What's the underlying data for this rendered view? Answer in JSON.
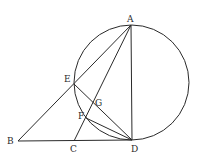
{
  "diagram": {
    "type": "geometry",
    "colors": {
      "line": "#2a2a2a",
      "background": "#ffffff"
    },
    "circle": {
      "cx": 131.5,
      "cy": 82.5,
      "r": 57.5
    },
    "points": {
      "A": {
        "x": 131,
        "y": 25,
        "label": "A",
        "lx": 127,
        "ly": 22
      },
      "B": {
        "x": 18,
        "y": 141,
        "label": "B",
        "lx": 7,
        "ly": 144
      },
      "C": {
        "x": 74,
        "y": 141,
        "label": "C",
        "lx": 70,
        "ly": 152
      },
      "D": {
        "x": 132,
        "y": 140,
        "label": "D",
        "lx": 131,
        "ly": 152
      },
      "E": {
        "x": 74,
        "y": 84,
        "label": "E",
        "lx": 64,
        "ly": 82
      },
      "F": {
        "x": 86,
        "y": 118,
        "label": "F",
        "lx": 78,
        "ly": 119
      },
      "G": {
        "x": 94,
        "y": 103,
        "label": "G",
        "lx": 95,
        "ly": 106
      }
    },
    "segments": [
      [
        "B",
        "D"
      ],
      [
        "B",
        "A"
      ],
      [
        "A",
        "D"
      ],
      [
        "A",
        "C"
      ],
      [
        "E",
        "D"
      ],
      [
        "F",
        "D"
      ]
    ],
    "arc": "E-F-D arc lies on circle"
  }
}
